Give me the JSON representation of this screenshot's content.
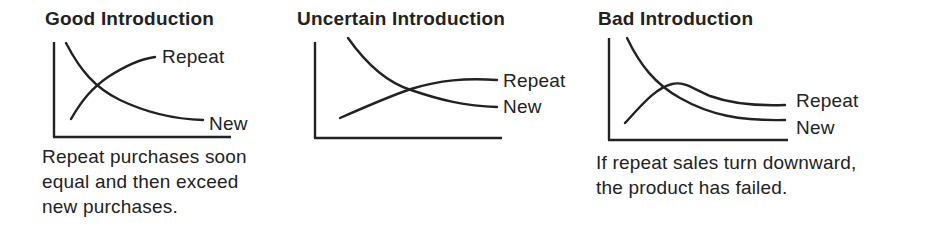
{
  "panels": [
    {
      "title": "Good Introduction",
      "labels": {
        "repeat": "Repeat",
        "new": "New"
      },
      "caption": [
        "Repeat purchases soon",
        "equal and then exceed",
        "new purchases."
      ]
    },
    {
      "title": "Uncertain Introduction",
      "labels": {
        "repeat": "Repeat",
        "new": "New"
      },
      "caption": []
    },
    {
      "title": "Bad Introduction",
      "labels": {
        "repeat": "Repeat",
        "new": "New"
      },
      "caption": [
        "If repeat sales turn downward,",
        "the product has failed."
      ]
    }
  ],
  "colors": {
    "ink": "#222222",
    "background": "#ffffff"
  }
}
